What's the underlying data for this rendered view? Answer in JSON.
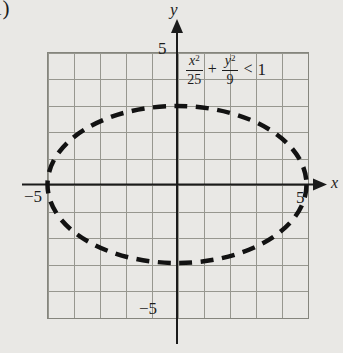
{
  "problem_number": "1)",
  "figure": {
    "type": "inequality-graph",
    "ellipse": {
      "center_x": 0,
      "center_y": 0,
      "semi_axis_x": 5,
      "semi_axis_y": 3,
      "boundary_style": "dashed"
    }
  },
  "axes": {
    "x_label": "x",
    "y_label": "y",
    "x_range": [
      -5,
      5
    ],
    "y_range": [
      -5,
      5
    ],
    "grid_cells": 10,
    "ticks": {
      "top": "5",
      "bottom": "−5",
      "left": "−5",
      "right": "5"
    }
  },
  "inequality": {
    "term1_base": "x",
    "term1_exp": "2",
    "term1_den": "25",
    "operator": "+",
    "term2_base": "y",
    "term2_exp": "2",
    "term2_den": "9",
    "relation": "<",
    "rhs": "1"
  },
  "colors": {
    "background": "#e9e8e5",
    "grid_line": "#97978f",
    "axis": "#1b1b1b",
    "curve": "#121212",
    "text": "#1c1c1c"
  }
}
